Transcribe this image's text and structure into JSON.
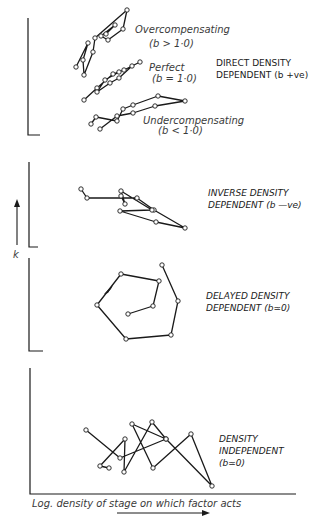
{
  "figure": {
    "y_axis_label": "k",
    "x_axis_label": "Log. density of stage on which factor acts",
    "panels": [
      {
        "id": "direct",
        "title_line1": "DIRECT DENSITY",
        "title_line2": "DEPENDENT (b +ve)",
        "subseries": [
          {
            "name": "Overcompensating",
            "note": "(b > 1·0)"
          },
          {
            "name": "Perfect",
            "note": "(b = 1·0)"
          },
          {
            "name": "Undercompensating",
            "note": "(b < 1·0)"
          }
        ]
      },
      {
        "id": "inverse",
        "title_line1": "INVERSE DENSITY",
        "title_line2": "DEPENDENT (b —ve)"
      },
      {
        "id": "delayed",
        "title_line1": "DELAYED DENSITY",
        "title_line2": "DEPENDENT (b≃0)"
      },
      {
        "id": "independent",
        "title_line1": "DENSITY",
        "title_line2": "INDEPENDENT",
        "title_line3": "(b≃0)"
      }
    ]
  },
  "chart_data": [
    {
      "type": "line",
      "title": "Direct density dependent (b +ve)",
      "xlabel": "Log. density of stage on which factor acts",
      "ylabel": "k",
      "series": [
        {
          "name": "Overcompensating (b > 1·0)",
          "points": [
            [
              76,
              67
            ],
            [
              88,
              43
            ],
            [
              83,
              60
            ],
            [
              84,
              75
            ],
            [
              93,
              52
            ],
            [
              95,
              38
            ],
            [
              127,
              10
            ],
            [
              123,
              29
            ],
            [
              108,
              40
            ],
            [
              101,
              36
            ],
            [
              115,
              25
            ],
            [
              106,
              34
            ]
          ]
        },
        {
          "name": "Perfect (b = 1·0)",
          "points": [
            [
              84,
              100
            ],
            [
              97,
              88
            ],
            [
              113,
              74
            ],
            [
              124,
              70
            ],
            [
              140,
              62
            ],
            [
              132,
              66
            ],
            [
              119,
              78
            ],
            [
              110,
              83
            ],
            [
              97,
              92
            ],
            [
              105,
              80
            ],
            [
              119,
              72
            ]
          ]
        },
        {
          "name": "Undercompensating (b < 1·0)",
          "points": [
            [
              91,
              124
            ],
            [
              96,
              117
            ],
            [
              117,
              121
            ],
            [
              123,
              109
            ],
            [
              133,
              105
            ],
            [
              158,
              96
            ],
            [
              185,
              101
            ],
            [
              155,
              106
            ],
            [
              133,
              113
            ],
            [
              117,
              116
            ],
            [
              100,
              129
            ]
          ]
        }
      ]
    },
    {
      "type": "line",
      "title": "Inverse density dependent (b -ve)",
      "xlabel": "Log. density of stage on which factor acts",
      "ylabel": "k",
      "series": [
        {
          "name": "Inverse",
          "points": [
            [
              81,
              189
            ],
            [
              87,
              198
            ],
            [
              137,
              198
            ],
            [
              154,
              210
            ],
            [
              185,
              228
            ],
            [
              156,
              222
            ],
            [
              120,
              211
            ],
            [
              152,
              210
            ],
            [
              121,
              191
            ],
            [
              125,
              204
            ],
            [
              121,
              196
            ]
          ]
        }
      ]
    },
    {
      "type": "line",
      "title": "Delayed density dependent (b≃0)",
      "xlabel": "Log. density of stage on which factor acts",
      "ylabel": "k",
      "series": [
        {
          "name": "Delayed",
          "points": [
            [
              128,
              314
            ],
            [
              153,
              306
            ],
            [
              159,
              281
            ],
            [
              121,
              274
            ],
            [
              97,
              305
            ],
            [
              126,
              339
            ],
            [
              171,
              335
            ],
            [
              178,
              301
            ],
            [
              162,
              265
            ]
          ]
        }
      ]
    },
    {
      "type": "line",
      "title": "Density independent (b≃0)",
      "xlabel": "Log. density of stage on which factor acts",
      "ylabel": "k",
      "series": [
        {
          "name": "Independent",
          "points": [
            [
              86,
              430
            ],
            [
              120,
              458
            ],
            [
              166,
              439
            ],
            [
              132,
              424
            ],
            [
              153,
              468
            ],
            [
              191,
              434
            ],
            [
              212,
              486
            ],
            [
              166,
              439
            ],
            [
              152,
              422
            ],
            [
              124,
              472
            ],
            [
              125,
              439
            ],
            [
              100,
              466
            ],
            [
              109,
              468
            ]
          ]
        }
      ]
    }
  ]
}
